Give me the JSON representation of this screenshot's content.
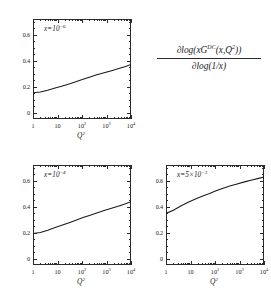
{
  "formula": {
    "numerator_prefix": "∂log(xG",
    "numerator_superscript": "DC",
    "numerator_suffix": "(x,Q",
    "numerator_q_exp": "2",
    "numerator_close": "))",
    "denominator": "∂log(1/x)"
  },
  "axes": {
    "x_title": "Q",
    "x_title_exp": "2",
    "x_ticklabels": [
      "1",
      "10",
      "10",
      "10",
      "10"
    ],
    "x_tick_exponents": [
      "",
      "",
      "2",
      "3",
      "4"
    ],
    "y_ticklabels": [
      "0",
      "0.2",
      "0.4",
      "0.6"
    ],
    "x_range_log10": [
      0,
      4
    ],
    "y_range": [
      -0.05,
      0.72
    ],
    "grid": "off"
  },
  "chart_data": {
    "type": "line",
    "xlabel": "Q^2",
    "ylabel": "dlog(xG^DC(x,Q^2))/dlog(1/x)",
    "xscale": "log",
    "xlim": [
      1,
      10000
    ],
    "ylim": [
      -0.05,
      0.72
    ],
    "panels": [
      {
        "id": "top",
        "annotation_prefix": "x=10",
        "annotation_exponent": "−6",
        "x": [
          1,
          2,
          4,
          8,
          16,
          32,
          60,
          110,
          200,
          400,
          800,
          1600,
          3200,
          6000,
          10000
        ],
        "y": [
          0.152,
          0.158,
          0.172,
          0.188,
          0.205,
          0.222,
          0.239,
          0.256,
          0.272,
          0.29,
          0.306,
          0.322,
          0.339,
          0.355,
          0.37
        ]
      },
      {
        "id": "bottom-left",
        "annotation_prefix": "x=10",
        "annotation_exponent": "−4",
        "x": [
          1,
          2,
          4,
          8,
          16,
          32,
          60,
          110,
          200,
          400,
          800,
          1600,
          3200,
          6000,
          10000
        ],
        "y": [
          0.192,
          0.2,
          0.218,
          0.238,
          0.258,
          0.278,
          0.297,
          0.315,
          0.332,
          0.351,
          0.369,
          0.387,
          0.404,
          0.421,
          0.438
        ]
      },
      {
        "id": "bottom-right",
        "annotation_prefix": "x=5×10",
        "annotation_exponent": "−3",
        "x": [
          1,
          2,
          4,
          8,
          16,
          32,
          60,
          110,
          200,
          400,
          800,
          1600,
          3200,
          6000,
          10000
        ],
        "y": [
          0.347,
          0.372,
          0.404,
          0.433,
          0.459,
          0.482,
          0.501,
          0.521,
          0.539,
          0.558,
          0.574,
          0.59,
          0.604,
          0.617,
          0.628
        ]
      }
    ]
  }
}
